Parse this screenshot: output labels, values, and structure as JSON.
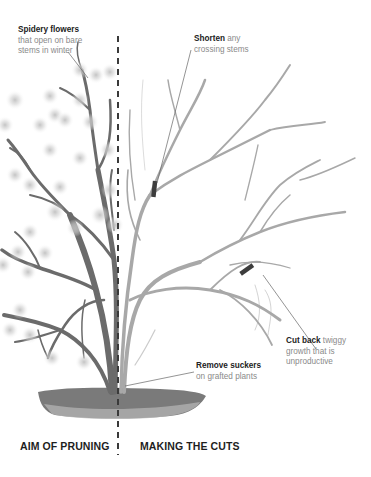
{
  "diagram": {
    "type": "pruning-illustration",
    "divider": {
      "style": "dashed",
      "color": "#3a3a3a",
      "x": 118
    },
    "colors": {
      "stem_left": "#6b6b6b",
      "stem_right": "#a8a8a8",
      "cut_marker": "#3d3d3d",
      "soil": "#7a7a7a",
      "label_bold": "#222222",
      "label_light": "#8a8a8a"
    }
  },
  "annotations": {
    "spidery_flowers": {
      "bold": "Spidery flowers",
      "line1": "that open on bare",
      "line2": "stems in winter"
    },
    "shorten": {
      "bold": "Shorten",
      "rest1": " any",
      "line2": "crossing stems"
    },
    "cut_back": {
      "bold": "Cut back",
      "rest1": " twiggy",
      "line2": "growth that is",
      "line3": "unproductive"
    },
    "remove_suckers": {
      "bold": "Remove suckers",
      "line2": "on grafted plants"
    }
  },
  "sections": {
    "left": "AIM OF PRUNING",
    "right": "MAKING THE CUTS"
  }
}
